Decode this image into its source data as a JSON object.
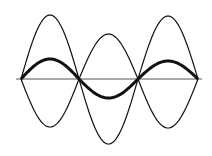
{
  "diagram": {
    "colors": {
      "background": "#ffffff",
      "stroke": "#111111",
      "axis": "#555555"
    },
    "axis": {
      "x1": 16,
      "x2": 202,
      "y": 79
    },
    "nodes_x": [
      21,
      79,
      138,
      198
    ],
    "loops": [
      {
        "x_start": 21,
        "x_end": 79,
        "env_top": 15,
        "env_bottom": 127,
        "wave_peak": 59
      },
      {
        "x_start": 79,
        "x_end": 138,
        "env_top": 34,
        "env_bottom": 144,
        "wave_peak": 98
      },
      {
        "x_start": 138,
        "x_end": 198,
        "env_top": 16,
        "env_bottom": 128,
        "wave_peak": 61
      }
    ]
  }
}
